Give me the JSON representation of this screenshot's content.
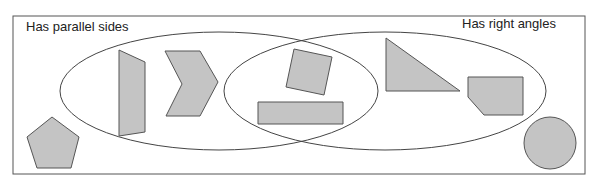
{
  "diagram": {
    "type": "venn",
    "sets": [
      {
        "id": "parallel",
        "label": "Has parallel sides"
      },
      {
        "id": "right",
        "label": "Has right angles"
      }
    ],
    "colors": {
      "background": "#ffffff",
      "border": "#555555",
      "ellipse_stroke": "#444444",
      "shape_fill": "#c4c4c4",
      "shape_stroke": "#555555"
    },
    "shapes": [
      {
        "name": "trapezoid",
        "region": "parallel_only",
        "points": "119,50 145,62 145,132 119,136"
      },
      {
        "name": "chevron",
        "region": "parallel_only",
        "points": "165,51 200,51 218,82 200,116 166,116 182,84"
      },
      {
        "name": "tilted-square",
        "region": "both",
        "points": "294,49 332,57 324,95 286,87"
      },
      {
        "name": "rectangle",
        "region": "both",
        "points": "258,102 343,102 343,124 258,124"
      },
      {
        "name": "right-triangle",
        "region": "right_only",
        "points": "386,38 386,91 460,91"
      },
      {
        "name": "cut-corner-pentagon",
        "region": "right_only",
        "points": "468,77 523,77 523,115 484,115 468,97"
      },
      {
        "name": "regular-pentagon",
        "region": "neither",
        "points": "52,117 79,137 71,168 37,168 27,137"
      },
      {
        "name": "circle",
        "region": "neither",
        "cx": 550,
        "cy": 143,
        "r": 26
      }
    ]
  }
}
